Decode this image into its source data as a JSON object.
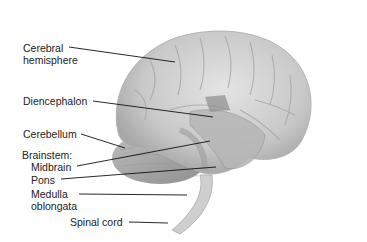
{
  "diagram": {
    "labels": [
      {
        "id": "cerebral",
        "lines": [
          "Cerebral",
          "hemisphere"
        ]
      },
      {
        "id": "diencephalon",
        "lines": [
          "Diencephalon"
        ]
      },
      {
        "id": "cerebellum",
        "lines": [
          "Cerebellum"
        ]
      },
      {
        "id": "brainstem",
        "lines": [
          "Brainstem:"
        ]
      },
      {
        "id": "midbrain",
        "lines": [
          "Midbrain"
        ]
      },
      {
        "id": "pons",
        "lines": [
          "Pons"
        ]
      },
      {
        "id": "medulla",
        "lines": [
          "Medulla",
          "oblongata"
        ]
      },
      {
        "id": "spinal",
        "lines": [
          "Spinal cord"
        ]
      }
    ]
  }
}
